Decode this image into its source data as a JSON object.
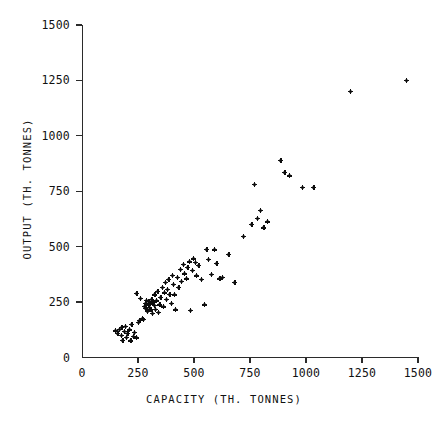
{
  "chart_data": {
    "type": "scatter",
    "title": "",
    "xlabel": "CAPACITY (TH. TONNES)",
    "ylabel": "OUTPUT (TH. TONNES)",
    "xlim": [
      0,
      1500
    ],
    "ylim": [
      0,
      1500
    ],
    "xticks": [
      0,
      250,
      500,
      750,
      1000,
      1250,
      1500
    ],
    "yticks": [
      0,
      250,
      500,
      750,
      1000,
      1250,
      1500
    ],
    "xtick_labels": [
      "0",
      "250",
      "500",
      "750",
      "1000",
      "1250",
      "1500"
    ],
    "ytick_labels": [
      "0",
      "250",
      "500",
      "750",
      "1000",
      "1250",
      "1500"
    ],
    "grid": false,
    "legend": false,
    "marker": "plus-dot",
    "marker_color": "#0d0d0d",
    "n_points": 95,
    "points": [
      [
        150,
        120
      ],
      [
        160,
        110
      ],
      [
        168,
        128
      ],
      [
        175,
        100
      ],
      [
        178,
        135
      ],
      [
        182,
        78
      ],
      [
        188,
        118
      ],
      [
        195,
        140
      ],
      [
        198,
        92
      ],
      [
        205,
        108
      ],
      [
        212,
        125
      ],
      [
        218,
        75
      ],
      [
        222,
        150
      ],
      [
        228,
        95
      ],
      [
        235,
        112
      ],
      [
        242,
        88
      ],
      [
        250,
        160
      ],
      [
        258,
        168
      ],
      [
        268,
        178
      ],
      [
        275,
        172
      ],
      [
        245,
        290
      ],
      [
        262,
        268
      ],
      [
        278,
        232
      ],
      [
        282,
        245
      ],
      [
        285,
        222
      ],
      [
        288,
        258
      ],
      [
        292,
        208
      ],
      [
        295,
        238
      ],
      [
        298,
        252
      ],
      [
        302,
        225
      ],
      [
        305,
        242
      ],
      [
        308,
        215
      ],
      [
        312,
        262
      ],
      [
        315,
        198
      ],
      [
        318,
        248
      ],
      [
        322,
        235
      ],
      [
        325,
        282
      ],
      [
        328,
        218
      ],
      [
        332,
        255
      ],
      [
        338,
        300
      ],
      [
        342,
        205
      ],
      [
        348,
        238
      ],
      [
        352,
        272
      ],
      [
        358,
        318
      ],
      [
        362,
        228
      ],
      [
        368,
        292
      ],
      [
        372,
        340
      ],
      [
        378,
        262
      ],
      [
        382,
        308
      ],
      [
        388,
        352
      ],
      [
        392,
        285
      ],
      [
        398,
        245
      ],
      [
        402,
        372
      ],
      [
        408,
        330
      ],
      [
        412,
        282
      ],
      [
        418,
        215
      ],
      [
        425,
        360
      ],
      [
        432,
        318
      ],
      [
        438,
        398
      ],
      [
        445,
        342
      ],
      [
        452,
        420
      ],
      [
        458,
        378
      ],
      [
        465,
        355
      ],
      [
        472,
        408
      ],
      [
        478,
        432
      ],
      [
        485,
        212
      ],
      [
        492,
        392
      ],
      [
        498,
        445
      ],
      [
        505,
        428
      ],
      [
        512,
        368
      ],
      [
        522,
        415
      ],
      [
        532,
        352
      ],
      [
        545,
        238
      ],
      [
        558,
        488
      ],
      [
        565,
        442
      ],
      [
        578,
        375
      ],
      [
        590,
        485
      ],
      [
        602,
        425
      ],
      [
        615,
        355
      ],
      [
        628,
        362
      ],
      [
        655,
        465
      ],
      [
        682,
        338
      ],
      [
        720,
        545
      ],
      [
        758,
        602
      ],
      [
        768,
        780
      ],
      [
        782,
        628
      ],
      [
        795,
        665
      ],
      [
        812,
        585
      ],
      [
        828,
        612
      ],
      [
        888,
        890
      ],
      [
        905,
        835
      ],
      [
        925,
        820
      ],
      [
        985,
        768
      ],
      [
        1035,
        768
      ],
      [
        1198,
        1200
      ],
      [
        1448,
        1250
      ]
    ]
  },
  "axes": {
    "x_title": "CAPACITY (TH. TONNES)",
    "y_title": "OUTPUT (TH. TONNES)"
  }
}
